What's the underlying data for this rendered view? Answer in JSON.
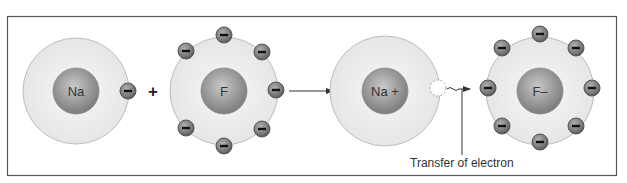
{
  "diagram": {
    "title": "",
    "atoms": [
      {
        "id": "na",
        "label": "Na",
        "cx": 76,
        "cy": 91,
        "shell_r": 53,
        "nucleus_r": 23,
        "electrons": [
          [
            128,
            91
          ]
        ]
      },
      {
        "id": "f",
        "label": "F",
        "cx": 224,
        "cy": 91,
        "shell_r": 54,
        "nucleus_r": 23,
        "electrons": [
          [
            224,
            35
          ],
          [
            186,
            51
          ],
          [
            262,
            52
          ],
          [
            276,
            90
          ],
          [
            186,
            128
          ],
          [
            262,
            129
          ],
          [
            224,
            146
          ]
        ]
      },
      {
        "id": "na-ion",
        "label": "Na +",
        "cx": 385,
        "cy": 91,
        "shell_r": 55,
        "nucleus_r": 23,
        "electrons": []
      },
      {
        "id": "f-ion",
        "label": "F–",
        "cx": 540,
        "cy": 91,
        "shell_r": 54,
        "nucleus_r": 23,
        "electrons": [
          [
            540,
            34
          ],
          [
            502,
            48
          ],
          [
            576,
            48
          ],
          [
            488,
            88
          ],
          [
            592,
            88
          ],
          [
            502,
            126
          ],
          [
            576,
            126
          ],
          [
            540,
            142
          ]
        ]
      }
    ],
    "plus_sign": "+",
    "annotation": "Transfer of electron",
    "colors": {
      "frame": "#555555",
      "shell_fill": "#eeeeee",
      "shell_stroke": "#b8b8b8",
      "nucleus": "#8a8a8a",
      "electron": "#7a7a7a",
      "text": "#222222"
    }
  }
}
